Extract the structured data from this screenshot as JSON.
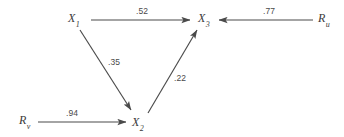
{
  "diagram": {
    "type": "path-diagram",
    "title": "",
    "background_color": "#ffffff",
    "line_color": "#4a4a4a",
    "text_color": "#3a3a3a",
    "nodes": [
      {
        "id": "X1",
        "name": "X",
        "subscript": "1",
        "x": 75,
        "y": 19
      },
      {
        "id": "X2",
        "name": "X",
        "subscript": "2",
        "x": 139,
        "y": 123
      },
      {
        "id": "X3",
        "name": "X",
        "subscript": "3",
        "x": 205,
        "y": 19
      },
      {
        "id": "Ru",
        "name": "R",
        "subscript": "u",
        "x": 325,
        "y": 19
      },
      {
        "id": "Rv",
        "name": "R",
        "subscript": "v",
        "x": 26,
        "y": 121
      }
    ],
    "paths": [
      {
        "id": "p_X1_X3",
        "from": "X1",
        "to": "X3",
        "coefficient": ".52",
        "label_x": 141,
        "label_y": 11
      },
      {
        "id": "p_X1_X2",
        "from": "X1",
        "to": "X2",
        "coefficient": ".35",
        "label_x": 112,
        "label_y": 62
      },
      {
        "id": "p_X2_X3",
        "from": "X2",
        "to": "X3",
        "coefficient": ".22",
        "label_x": 177,
        "label_y": 78
      },
      {
        "id": "p_Ru_X3",
        "from": "Ru",
        "to": "X3",
        "coefficient": ".77",
        "label_x": 268,
        "label_y": 11
      },
      {
        "id": "p_Rv_X2",
        "from": "Rv",
        "to": "X2",
        "coefficient": ".94",
        "label_x": 71,
        "label_y": 113
      }
    ],
    "geometry": {
      "line_X1_X3": {
        "x1": 91,
        "y1": 20,
        "x2": 190,
        "y2": 20
      },
      "line_X1_X2": {
        "x1": 80,
        "y1": 29,
        "x2": 131,
        "y2": 110
      },
      "line_X2_X3": {
        "x1": 148,
        "y1": 113,
        "x2": 197,
        "y2": 30
      },
      "line_Ru_X3": {
        "x1": 313,
        "y1": 20,
        "x2": 219,
        "y2": 20
      },
      "line_Rv_X2": {
        "x1": 38,
        "y1": 122,
        "x2": 126,
        "y2": 122
      }
    }
  }
}
